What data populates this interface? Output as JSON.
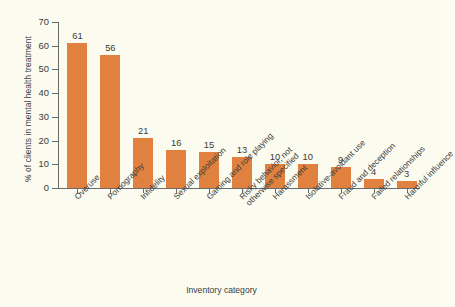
{
  "chart_data": {
    "type": "bar",
    "title": "",
    "xlabel": "Inventory category",
    "ylabel": "% of clients in mental health treatment",
    "categories": [
      "Overuse",
      "Pornography",
      "Infidelity",
      "Sexual exploitation",
      "Gaming and role playing",
      "Risky behavior, not otherwise specified",
      "Harassment",
      "Isolative-avoidant use",
      "Fraud and deception",
      "Failed relationships",
      "Harmful influence"
    ],
    "category_lines": [
      [
        "Overuse"
      ],
      [
        "Pornography"
      ],
      [
        "Infidelity"
      ],
      [
        "Sexual exploitation"
      ],
      [
        "Gaming and role playing"
      ],
      [
        "Risky behavior, not",
        "otherwise specified"
      ],
      [
        "Harassment"
      ],
      [
        "Isolative-avoidant use"
      ],
      [
        "Fraud and deception"
      ],
      [
        "Failed relationships"
      ],
      [
        "Harmful influence"
      ]
    ],
    "values": [
      61,
      56,
      21,
      16,
      15,
      13,
      10,
      10,
      9,
      4,
      3
    ],
    "value_labels": [
      "61",
      "56",
      "21",
      "16",
      "15",
      "13",
      "10",
      "10",
      "9",
      "4",
      "3"
    ],
    "ylim": [
      0,
      70
    ],
    "ytick_labels": [
      "70",
      "60",
      "50",
      "40",
      "30",
      "20",
      "10",
      "0"
    ],
    "ytick_values": [
      70,
      60,
      50,
      40,
      30,
      20,
      10,
      0
    ],
    "grid": false,
    "legend": false,
    "bar_color": "#e0813f",
    "background_color": "#fbfbf0",
    "text_color": "#3b3b3b",
    "axis_color": "#6b6b6b"
  }
}
